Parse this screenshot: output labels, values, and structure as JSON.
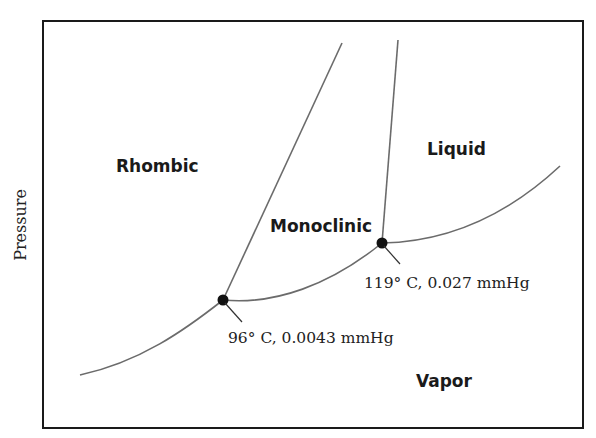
{
  "diagram": {
    "y_axis_label": "Pressure",
    "regions": [
      {
        "id": "rhombic",
        "label": "Rhombic"
      },
      {
        "id": "monoclinic",
        "label": "Monoclinic"
      },
      {
        "id": "liquid",
        "label": "Liquid"
      },
      {
        "id": "vapor",
        "label": "Vapor"
      }
    ],
    "triple_points": [
      {
        "id": "tp1",
        "label": "96° C, 0.0043 mmHg",
        "temperature_c": 96,
        "pressure_mmhg": 0.0043
      },
      {
        "id": "tp2",
        "label": "119° C, 0.027 mmHg",
        "temperature_c": 119,
        "pressure_mmhg": 0.027
      }
    ],
    "colors": {
      "frame": "#1a1a1a",
      "curve": "#6b6b6b",
      "point": "#111111",
      "background": "#ffffff"
    }
  }
}
